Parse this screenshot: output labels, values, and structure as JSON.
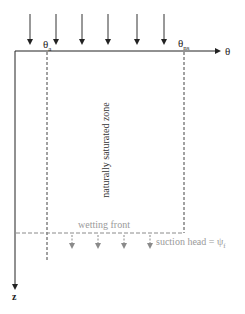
{
  "diagram": {
    "axes": {
      "x_label": "θ",
      "z_label": "z"
    },
    "labels": {
      "theta_a": "θ",
      "theta_a_sub": "a",
      "theta_ns": "θ",
      "theta_ns_sub": "ns",
      "zone": "naturally saturated zone",
      "wetting_front": "wetting front",
      "suction_head": "suction head = ψ",
      "suction_head_sub": "f"
    },
    "rain_arrows_x": [
      30,
      56,
      82,
      108,
      137,
      164
    ],
    "suction_arrows_x": [
      72,
      98,
      124,
      150
    ],
    "colors": {
      "axis": "#222222",
      "dashed": "#444444",
      "wetting": "#8a8a8a",
      "suction_text": "#9a9a9a"
    }
  }
}
